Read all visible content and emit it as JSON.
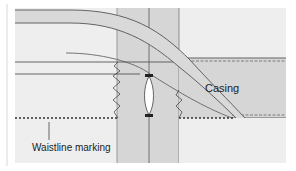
{
  "labels": {
    "casing": "Casing",
    "waistline": "Waistline marking"
  },
  "colors": {
    "background": "#ffffff",
    "panel": "#eeeeee",
    "fabric_band": "#d6d6d6",
    "casing_band": "#d6d6d6",
    "curve_band": "#d9d9d9",
    "line": "#555555",
    "dash": "#444444"
  }
}
